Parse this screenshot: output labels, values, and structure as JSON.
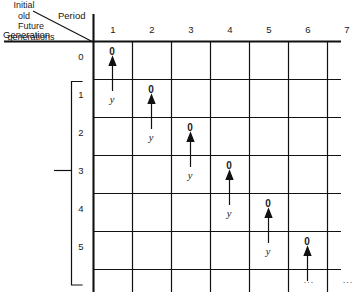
{
  "figure": {
    "axis_titles": {
      "period": "Period",
      "generation": "Generation"
    },
    "row_groups": [
      {
        "name": "initial-old",
        "label": "Initial\nold"
      },
      {
        "name": "future-generations",
        "label": "Future\ngenerations"
      }
    ],
    "group_labels": {
      "initial_old": "Initial old",
      "initial_old_line1": "Initial",
      "initial_old_line2": "old",
      "future_generations_line1": "Future",
      "future_generations_line2": "generations"
    },
    "period_headers": [
      "1",
      "2",
      "3",
      "4",
      "5",
      "6",
      "7"
    ],
    "generation_labels": [
      "0",
      "1",
      "2",
      "3",
      "4",
      "5"
    ],
    "cells": [
      {
        "generation": "0",
        "period": "1",
        "zero": "0",
        "y": "y"
      },
      {
        "generation": "1",
        "period": "2",
        "zero": "0",
        "y": "y"
      },
      {
        "generation": "2",
        "period": "3",
        "zero": "0",
        "y": "y"
      },
      {
        "generation": "3",
        "period": "4",
        "zero": "0",
        "y": "y"
      },
      {
        "generation": "4",
        "period": "5",
        "zero": "0",
        "y": "y"
      },
      {
        "generation": "5",
        "period": "6",
        "zero": "0",
        "y": ""
      }
    ],
    "zero_symbol": "0",
    "y_symbol": "y",
    "ellipsis": "...",
    "ellipsis_columns": [
      "6",
      "7"
    ],
    "colors": {
      "line": "#111111",
      "text": "#161616",
      "background": "#ffffff"
    }
  }
}
